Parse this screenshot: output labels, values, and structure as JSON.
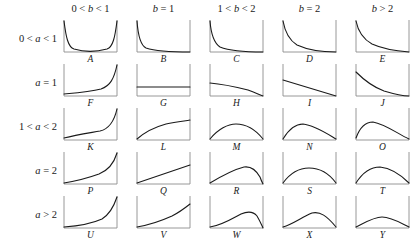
{
  "figure": {
    "axis_color": "#8c8c8c",
    "curve_color": "#1a1a1a",
    "background": "#ffffff"
  },
  "columns": [
    {
      "id": "col-b-0-1",
      "label": "0 < b < 1"
    },
    {
      "id": "col-b-eq-1",
      "label": "b = 1"
    },
    {
      "id": "col-b-1-2",
      "label": "1 < b < 2"
    },
    {
      "id": "col-b-eq-2",
      "label": "b = 2"
    },
    {
      "id": "col-b-gt-2",
      "label": "b > 2"
    }
  ],
  "rows": [
    {
      "id": "row-a-0-1",
      "label": "0 < a < 1"
    },
    {
      "id": "row-a-eq-1",
      "label": "a = 1"
    },
    {
      "id": "row-a-1-2",
      "label": "1 < a < 2"
    },
    {
      "id": "row-a-eq-2",
      "label": "a = 2"
    },
    {
      "id": "row-a-gt-2",
      "label": "a > 2"
    }
  ],
  "chart_data": {
    "type": "line",
    "xlabel": "",
    "ylabel": "",
    "xlim": [
      0,
      1
    ],
    "ylim": [
      0,
      1
    ],
    "grid": false,
    "legend": "none",
    "layout": {
      "rows": 5,
      "cols": 5
    },
    "panels": [
      {
        "letter": "A",
        "row": "0 < a < 1",
        "col": "0 < b < 1",
        "shape": "U-shaped",
        "description": "decreasing from left asymptote to flat minimum, then rising to right asymptote",
        "path": "M 2,2 C 4,18 6,28 12,30 C 22,33 34,33 45,30 C 51,28 53,18 55,2"
      },
      {
        "letter": "B",
        "row": "0 < a < 1",
        "col": "b = 1",
        "shape": "decreasing convex",
        "description": "steep left asymptote decaying to near-zero along baseline",
        "path": "M 2,2 C 3,16 5,26 11,29 C 20,32 34,33 55,33"
      },
      {
        "letter": "C",
        "row": "0 < a < 1",
        "col": "1 < b < 2",
        "shape": "decreasing convex",
        "description": "left asymptote decaying, reaching zero at right edge",
        "path": "M 2,2 C 3,15 6,24 12,28 C 22,32 38,33 55,33"
      },
      {
        "letter": "D",
        "row": "0 < a < 1",
        "col": "b = 2",
        "shape": "decreasing convex",
        "description": "left asymptote with gentler decay, reaching zero at right edge",
        "path": "M 2,2 C 4,13 8,21 16,26 C 27,31 41,33 55,33"
      },
      {
        "letter": "E",
        "row": "0 < a < 1",
        "col": "b > 2",
        "shape": "decreasing convex",
        "description": "left asymptote, convex decay to zero at right edge",
        "path": "M 2,2 C 4,12 9,20 18,25 C 29,30 42,32 55,33"
      },
      {
        "letter": "F",
        "row": "a = 1",
        "col": "0 < b < 1",
        "shape": "increasing convex",
        "description": "flat near baseline then rising to right asymptote",
        "path": "M 2,31 C 14,30 28,29 39,26 C 48,23 52,16 55,2"
      },
      {
        "letter": "G",
        "row": "a = 1",
        "col": "b = 1",
        "shape": "uniform flat",
        "description": "horizontal constant line (uniform density)",
        "path": "M 2,24 L 55,24"
      },
      {
        "letter": "H",
        "row": "a = 1",
        "col": "1 < b < 2",
        "shape": "decreasing concave",
        "description": "starts at moderate height, slowly decreasing then dropping to zero at right",
        "path": "M 2,20 C 14,21 28,24 40,27 C 48,30 52,32 55,33"
      },
      {
        "letter": "I",
        "row": "a = 1",
        "col": "b = 2",
        "shape": "linear decreasing",
        "description": "straight line from positive left intercept down to zero at right",
        "path": "M 2,17 L 55,33"
      },
      {
        "letter": "J",
        "row": "a = 1",
        "col": "b > 2",
        "shape": "decreasing convex",
        "description": "finite left value decaying convexly to zero at right",
        "path": "M 2,9 C 10,17 19,24 30,28 C 40,31 48,33 55,33"
      },
      {
        "letter": "K",
        "row": "1 < a < 2",
        "col": "0 < b < 1",
        "shape": "increasing convex",
        "description": "zero at left, slowly rising then steep right asymptote",
        "path": "M 2,31 C 14,28 27,26 38,24 C 47,22 52,15 55,2"
      },
      {
        "letter": "L",
        "row": "1 < a < 2",
        "col": "b = 1",
        "shape": "increasing concave",
        "description": "zero at left rising concavely to a finite positive right value",
        "path": "M 2,32 C 10,25 20,20 31,17 C 41,15 49,14 55,13"
      },
      {
        "letter": "M",
        "row": "1 < a < 2",
        "col": "1 < b < 2",
        "shape": "symmetric hump",
        "description": "zero at both ends with a broad low symmetric mode near the centre",
        "path": "M 2,32 C 10,22 20,17 28,17 C 37,17 47,22 55,32"
      },
      {
        "letter": "N",
        "row": "1 < a < 2",
        "col": "b = 2",
        "shape": "left-skewed hump",
        "description": "zero at both ends, mode left of centre with longer right tail",
        "path": "M 2,32 C 8,22 15,17 22,17 C 33,18 45,26 55,32"
      },
      {
        "letter": "O",
        "row": "1 < a < 2",
        "col": "b > 2",
        "shape": "left-shifted hump",
        "description": "zero at both ends, mode well left of centre, long right tail",
        "path": "M 2,31 C 6,20 12,15 19,15 C 31,17 44,27 55,32"
      },
      {
        "letter": "P",
        "row": "a = 2",
        "col": "0 < b < 1",
        "shape": "increasing convex",
        "description": "zero at left, convex rise to steep right asymptote",
        "path": "M 2,32 C 14,30 26,27 37,23 C 47,19 52,12 55,2"
      },
      {
        "letter": "Q",
        "row": "a = 2",
        "col": "b = 1",
        "shape": "linear increasing",
        "description": "straight line from zero at left up to a positive right value",
        "path": "M 2,32 L 55,14"
      },
      {
        "letter": "R",
        "row": "a = 2",
        "col": "1 < b < 2",
        "shape": "right-skewed hump",
        "description": "zero at left, rising to a mode right of centre then dropping steeply to zero",
        "path": "M 2,32 C 12,26 24,19 36,16 C 43,15 48,19 52,26 C 53,29 54,31 55,33"
      },
      {
        "letter": "S",
        "row": "a = 2",
        "col": "b = 2",
        "shape": "symmetric hump",
        "description": "zero at both ends with a symmetric mode at the centre",
        "path": "M 2,32 C 10,21 19,17 28,17 C 38,17 47,21 55,32"
      },
      {
        "letter": "T",
        "row": "a = 2",
        "col": "b > 2",
        "shape": "symmetric hump",
        "description": "zero at both ends, mode slightly left of centre",
        "path": "M 2,32 C 9,21 17,16 26,16 C 36,17 46,23 55,32"
      },
      {
        "letter": "U",
        "row": "a > 2",
        "col": "0 < b < 1",
        "shape": "increasing convex",
        "description": "flat at zero then sharply rising to a steep right asymptote",
        "path": "M 2,32 C 16,31 29,29 40,24 C 48,19 52,11 55,2"
      },
      {
        "letter": "V",
        "row": "a > 2",
        "col": "b = 1",
        "shape": "increasing convex",
        "description": "zero at left rising convexly to a positive right value",
        "path": "M 2,32 C 14,30 26,26 37,21 C 45,17 50,13 55,9"
      },
      {
        "letter": "W",
        "row": "a > 2",
        "col": "1 < b < 2",
        "shape": "right-skewed hump",
        "description": "long flat left tail, mode right of centre, sharp drop to zero at right",
        "path": "M 2,32 C 12,31 22,25 33,19 C 40,16 45,16 49,21 C 52,26 54,31 55,33"
      },
      {
        "letter": "X",
        "row": "a > 2",
        "col": "b = 2",
        "shape": "hump near centre",
        "description": "zero at both ends, smooth mode around the centre with slight right skew",
        "path": "M 2,32 C 12,29 21,22 31,18 C 39,16 46,21 55,32"
      },
      {
        "letter": "Y",
        "row": "a > 2",
        "col": "b > 2",
        "shape": "symmetric low hump",
        "description": "zero at both ends with a broad flat symmetric mode at the centre",
        "path": "M 2,32 C 12,27 20,22 28,22 C 37,22 45,27 55,32"
      }
    ]
  }
}
